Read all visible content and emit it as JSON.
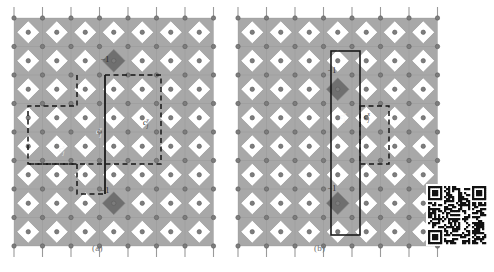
{
  "figure": {
    "type": "lattice-diagram",
    "background": "#ffffff",
    "panels": [
      {
        "id": "a",
        "caption": "(a)",
        "origin_x": 14,
        "origin_y": 18,
        "cols": 7,
        "rows": 8,
        "cell": 28.5,
        "labels": [
          {
            "name": "minus-one-top",
            "text": "−1",
            "x": 105,
            "y": 62,
            "color": "#2b2b2b",
            "size": 8
          },
          {
            "name": "minus-one-bottom",
            "text": "−1",
            "x": 105,
            "y": 193,
            "color": "#2b2b2b",
            "size": 8
          },
          {
            "name": "operator-center",
            "text": "c",
            "sub": "j",
            "sup": "y",
            "x": 99,
            "y": 134,
            "color": "#f2f2f2",
            "size": 8
          },
          {
            "name": "operator-left",
            "text": "c",
            "sub": "j",
            "sup": "x",
            "x": 62,
            "y": 152,
            "color": "#f2f2f2",
            "size": 8
          },
          {
            "name": "operator-right",
            "text": "c",
            "sub": "j",
            "sup": "y",
            "x": 146,
            "y": 125,
            "color": "#2b2b2b",
            "size": 8
          }
        ],
        "marked_cells": [
          {
            "name": "dark-diamond-top",
            "col": 3,
            "row": 1,
            "fill": "#6f6f6f"
          },
          {
            "name": "dark-diamond-bottom",
            "col": 3,
            "row": 6,
            "fill": "#6f6f6f"
          }
        ],
        "solid_line": {
          "name": "string-operator-line",
          "x": 105,
          "y1": 75,
          "y2": 194,
          "width": 1.8,
          "color": "#1a1a1a"
        },
        "dashed_paths": [
          {
            "name": "dashed-loop-upper",
            "points": "77,75 77,106 28,106 28,164 77,164 77,194 105,194"
          },
          {
            "name": "dashed-loop-lower",
            "points": "105,75 161,75 161,106 161,135 161,164 28,164"
          }
        ]
      },
      {
        "id": "b",
        "caption": "(b)",
        "origin_x": 238,
        "origin_y": 18,
        "cols": 7,
        "rows": 8,
        "cell": 28.5,
        "labels": [
          {
            "name": "minus-one-top",
            "text": "−1",
            "x": 332,
            "y": 73,
            "color": "#2b2b2b",
            "size": 8
          },
          {
            "name": "minus-one-bottom",
            "text": "−1",
            "x": 332,
            "y": 191,
            "color": "#2b2b2b",
            "size": 8
          },
          {
            "name": "operator-left",
            "text": "c",
            "sub": "j",
            "sup": "y",
            "x": 343,
            "y": 119,
            "color": "#f2f2f2",
            "size": 8
          },
          {
            "name": "operator-right",
            "text": "c",
            "sub": "j",
            "sup": "x",
            "x": 367,
            "y": 119,
            "color": "#2b2b2b",
            "size": 8
          }
        ],
        "marked_cells": [
          {
            "name": "dark-diamond-top",
            "col": 3,
            "row": 2,
            "fill": "#6f6f6f"
          },
          {
            "name": "dark-diamond-bottom",
            "col": 3,
            "row": 6,
            "fill": "#6f6f6f"
          }
        ],
        "solid_rect": {
          "name": "unit-cell-rectangle",
          "x": 331,
          "y": 51,
          "w": 29,
          "h": 184,
          "color": "#1a1a1a",
          "width": 1.6
        },
        "dashed_rect": {
          "name": "dashed-plaquette",
          "x": 360,
          "y": 106,
          "w": 29,
          "h": 58
        }
      }
    ],
    "lattice_style": {
      "plaquette_fill": "#a8a8a8",
      "plaquette_stroke": "#8c8c8c",
      "node_fill": "#7d7d7d",
      "node_stroke": "#5c5c5c",
      "node_radius": 2.2,
      "stem_color": "#9a9a9a",
      "hole_fill": "#ffffff"
    },
    "qr_code": {
      "name": "qr-code",
      "x": 428,
      "y": 186,
      "size": 58,
      "modules": 29
    }
  }
}
